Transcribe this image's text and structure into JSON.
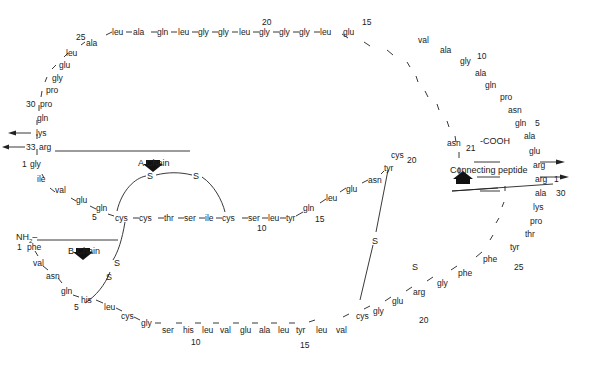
{
  "colors": {
    "ink": "#222222",
    "background": "#ffffff"
  },
  "labels": {
    "a_chain": "A Chain",
    "b_chain": "B Chain",
    "connecting_peptide": "Connecting peptide",
    "nh2": "NH2",
    "cooh": "-COOH",
    "disulfide": "S"
  },
  "connecting_peptide_top": {
    "residues": [
      "leu",
      "ala",
      "gln",
      "leu",
      "gly",
      "gly",
      "leu",
      "gly",
      "gly",
      "gly",
      "leu",
      "glu",
      "val",
      "ala",
      "gly",
      "ala",
      "gln",
      "pro",
      "asn",
      "gln",
      "ala",
      "glu",
      "arg",
      "arg"
    ],
    "numbers": {
      "n20": "20",
      "n15": "15",
      "n10": "10",
      "n5": "5",
      "n1": "1"
    }
  },
  "connecting_peptide_left": {
    "residues": [
      "ala",
      "leu",
      "glu",
      "gly",
      "pro",
      "pro",
      "gln",
      "lys",
      "arg"
    ],
    "numbers": {
      "n25": "25",
      "n30": "30",
      "n33": "33"
    }
  },
  "a_chain": {
    "residues": [
      "gly",
      "ile",
      "val",
      "glu",
      "gln",
      "cys",
      "cys",
      "thr",
      "ser",
      "ile",
      "cys",
      "ser",
      "leu",
      "tyr",
      "gln",
      "leu",
      "glu",
      "asn",
      "tyr",
      "cys",
      "asn"
    ],
    "numbers": {
      "n1": "1",
      "n5": "5",
      "n10": "10",
      "n15": "15",
      "n20": "20",
      "n21": "21"
    }
  },
  "b_chain": {
    "residues": [
      "phe",
      "val",
      "asn",
      "gln",
      "his",
      "leu",
      "cys",
      "gly",
      "ser",
      "his",
      "leu",
      "val",
      "glu",
      "ala",
      "leu",
      "tyr",
      "leu",
      "val",
      "cys",
      "gly",
      "glu",
      "arg",
      "gly",
      "phe",
      "phe",
      "tyr",
      "thr",
      "pro",
      "lys",
      "ala"
    ],
    "numbers": {
      "n1": "1",
      "n5": "5",
      "n10": "10",
      "n15": "15",
      "n20": "20",
      "n25": "25",
      "n30": "30"
    }
  }
}
